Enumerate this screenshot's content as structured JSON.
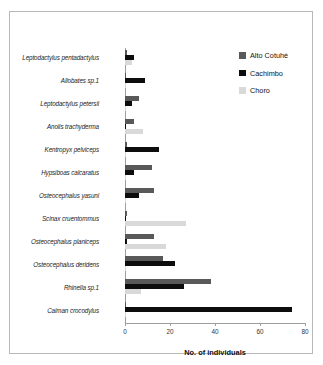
{
  "chart_data": {
    "type": "bar",
    "orientation": "horizontal",
    "title": "",
    "xlabel": "No. of individuals",
    "ylabel": "",
    "xlim": [
      0,
      80
    ],
    "xticks": [
      0,
      20,
      40,
      60,
      80
    ],
    "grid": false,
    "legend_position": "top-right",
    "categories": [
      "Leptodactylus pentadactylus",
      "Allobates sp.1",
      "Leptodactylus petersii",
      "Anolis trachyderma",
      "Kentropyx pelviceps",
      "Hypsiboas calcaratus",
      "Osteocephalus yasuni",
      "Scinax cruentommus",
      "Osteocephalus planiceps",
      "Osteocephalus deridens",
      "Rhinella sp.1",
      "Caiman crocodylus"
    ],
    "series": [
      {
        "name": "Alto Cotuhé",
        "color": "#595959",
        "values": [
          1,
          0,
          6,
          4,
          1,
          12,
          13,
          1,
          13,
          17,
          38,
          0
        ]
      },
      {
        "name": "Cachimbo",
        "color": "#0d0d0d",
        "values": [
          4,
          9,
          3,
          0,
          15,
          4,
          6,
          0,
          1,
          22,
          26,
          74
        ]
      },
      {
        "name": "Choro",
        "color": "#d9d9d9",
        "values": [
          3,
          0,
          0,
          8,
          0,
          0,
          0,
          27,
          18,
          0,
          7,
          0
        ]
      }
    ]
  },
  "legend": {
    "items": [
      {
        "label": "Alto Cotuhé",
        "icon": "square-swatch-dark-gray"
      },
      {
        "label": "Cachimbo",
        "icon": "square-swatch-black"
      },
      {
        "label": "Choro",
        "icon": "square-swatch-light-gray"
      }
    ]
  },
  "axis": {
    "x_title": "No. of individuals",
    "tick_labels": [
      "0",
      "20",
      "40",
      "60",
      "80"
    ]
  }
}
